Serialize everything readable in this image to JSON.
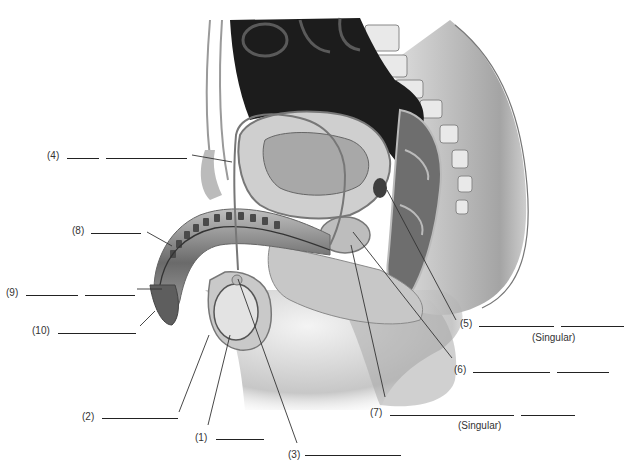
{
  "diagram": {
    "type": "anatomical-labeling-worksheet",
    "palette": {
      "ink": "#222222",
      "shade_dark": "#1a1a1a",
      "shade_mid": "#8a8a8a",
      "shade_light": "#d6d6d6",
      "background": "#ffffff"
    }
  },
  "labels": [
    {
      "id": 1,
      "text": "(1)",
      "blanks": 1,
      "note": ""
    },
    {
      "id": 2,
      "text": "(2)",
      "blanks": 1,
      "note": ""
    },
    {
      "id": 3,
      "text": "(3)",
      "blanks": 1,
      "note": ""
    },
    {
      "id": 4,
      "text": "(4)",
      "blanks": 2,
      "note": ""
    },
    {
      "id": 5,
      "text": "(5)",
      "blanks": 2,
      "note": "(Singular)"
    },
    {
      "id": 6,
      "text": "(6)",
      "blanks": 2,
      "note": ""
    },
    {
      "id": 7,
      "text": "(7)",
      "blanks": 2,
      "note": "(Singular)"
    },
    {
      "id": 8,
      "text": "(8)",
      "blanks": 1,
      "note": ""
    },
    {
      "id": 9,
      "text": "(9)",
      "blanks": 2,
      "note": ""
    },
    {
      "id": 10,
      "text": "(10)",
      "blanks": 1,
      "note": ""
    }
  ]
}
